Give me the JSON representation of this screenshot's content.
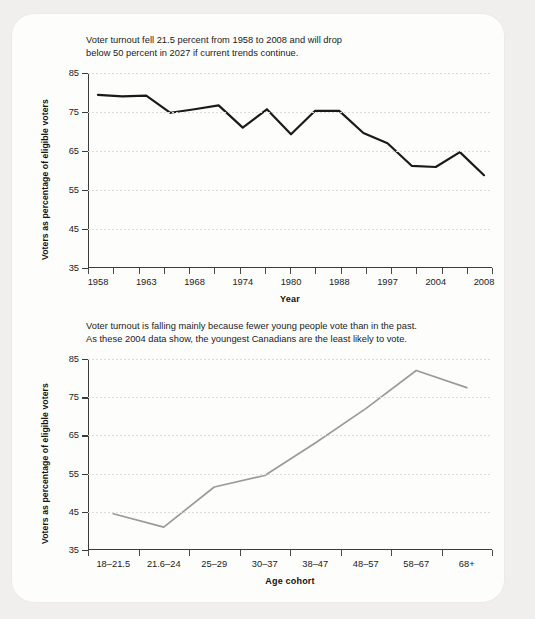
{
  "document": {
    "background_color": "#f0efee",
    "card_color": "#fdfdfc"
  },
  "panels": [
    {
      "id": "turnout-by-year",
      "caption": "Voter turnout fell 21.5 percent from 1958 to 2008 and will drop\nbelow 50 percent in 2027 if current trends continue.",
      "chart_data": {
        "type": "line",
        "title": "",
        "xlabel": "Year",
        "ylabel": "Voters as percentage of eligible voters",
        "ylim": [
          35,
          85
        ],
        "yticks": [
          35,
          45,
          55,
          65,
          75,
          85
        ],
        "xlim": [
          0,
          16
        ],
        "tick_labels": [
          "1958",
          "1963",
          "1968",
          "1974",
          "1980",
          "1988",
          "1997",
          "2004",
          "2008"
        ],
        "tick_positions": [
          0,
          2,
          4,
          6,
          8,
          10,
          12,
          14,
          16
        ],
        "grid": true,
        "legend": "none",
        "line_color": "#1a1a1a",
        "x": [
          0,
          1,
          2,
          3,
          4,
          5,
          6,
          7,
          8,
          9,
          10,
          11,
          12,
          13,
          14,
          15,
          16
        ],
        "values": [
          80.5,
          80.0,
          79.7,
          79.5,
          76.7,
          76.0,
          76.0,
          77.3,
          71.0,
          75.9,
          69.6,
          75.9,
          75.7,
          75.3,
          73.4,
          71.0,
          69.6
        ],
        "series": [
          {
            "name": "Voter turnout",
            "categories": [
              "1958",
              "1962",
              "1963",
              "1965",
              "1968",
              "1972",
              "1974",
              "1979",
              "1980",
              "1984",
              "1988",
              "1993",
              "1997",
              "2000",
              "2004",
              "2006",
              "2008"
            ],
            "values": [
              79.4,
              79.0,
              79.2,
              74.8,
              75.7,
              76.7,
              71.0,
              75.7,
              69.3,
              75.3,
              75.3,
              69.6,
              67.0,
              61.2,
              60.9,
              64.7,
              58.8
            ]
          }
        ]
      }
    },
    {
      "id": "turnout-by-age-cohort",
      "caption": "Voter turnout is falling mainly because fewer young people vote than in the past.\nAs these 2004 data show, the youngest Canadians are the least likely to vote.",
      "chart_data": {
        "type": "line",
        "title": "",
        "xlabel": "Age cohort",
        "ylabel": "Voters as percentage of eligible voters",
        "ylim": [
          35,
          85
        ],
        "yticks": [
          35,
          45,
          55,
          65,
          75,
          85
        ],
        "grid": true,
        "legend": "none",
        "line_color": "#9a9a9a",
        "categories": [
          "18–21.5",
          "21.6–24",
          "25–29",
          "30–37",
          "38–47",
          "48–57",
          "58–67",
          "68+"
        ],
        "values": [
          44.5,
          41.0,
          51.5,
          54.5,
          63.0,
          72.0,
          82.0,
          77.5
        ]
      }
    }
  ]
}
